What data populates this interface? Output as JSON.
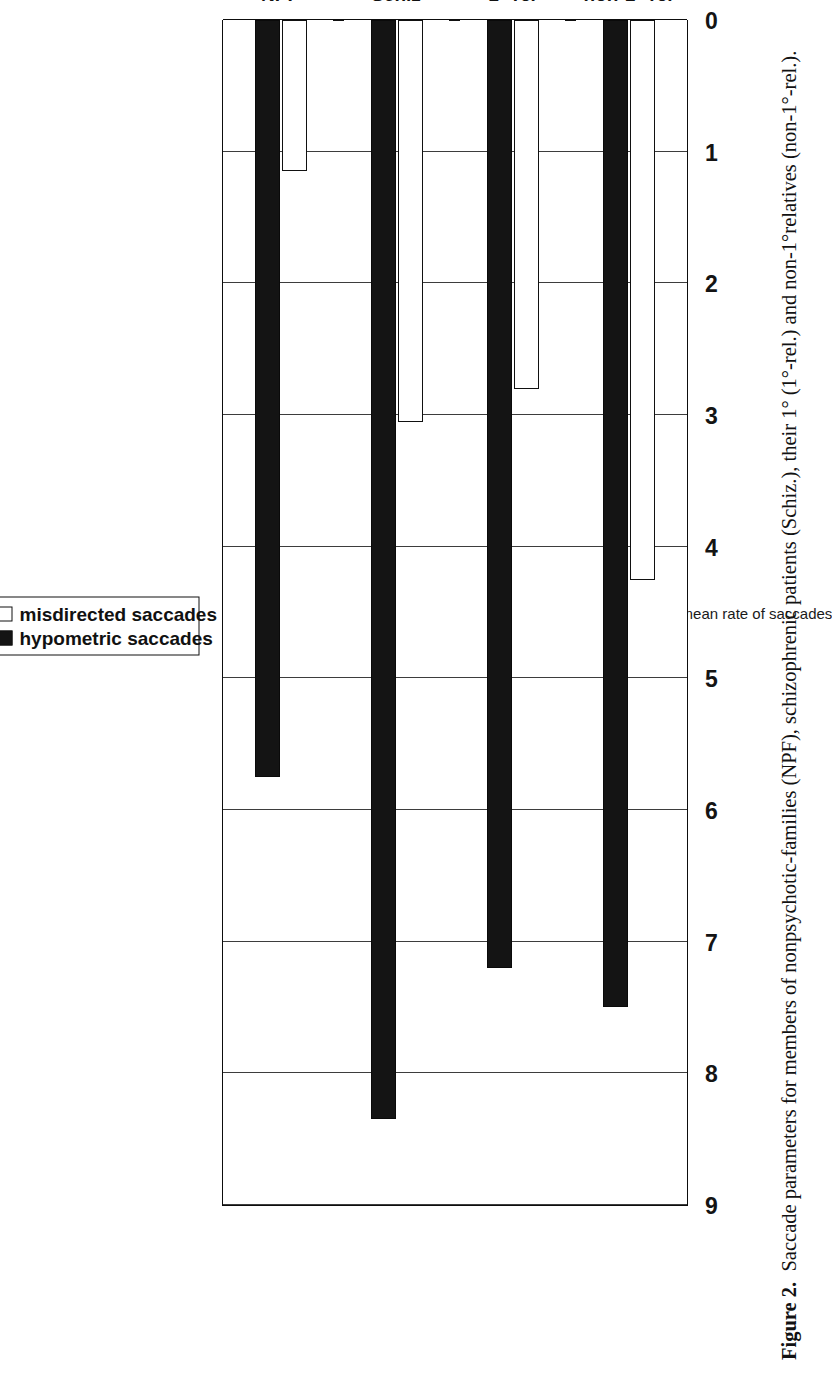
{
  "figure": {
    "caption_lead": "Figure 2.",
    "caption_body": "Saccade parameters for members of nonpsychotic-families (NPF), schizophrenic patients (Schiz.), their 1° (1°-rel.) and non-1°relatives (non-1°-rel.)."
  },
  "legend": {
    "position": "top-center",
    "entries": [
      {
        "label": "misdirected saccades",
        "swatch": "open-square-icon",
        "color": "#ffffff"
      },
      {
        "label": "hypometric saccades",
        "swatch": "filled-square-icon",
        "color": "#141414"
      }
    ]
  },
  "chart_data": {
    "type": "bar",
    "orientation": "horizontal",
    "title": "",
    "subtitle": "",
    "xlabel": "",
    "ylabel": "mean rate of saccades",
    "categories": [
      "NPF",
      "Schiz",
      "1°-rel",
      "non-1°-rel"
    ],
    "series": [
      {
        "name": "misdirected saccades",
        "values": [
          1.15,
          3.05,
          2.8,
          4.25
        ],
        "fill": "#ffffff",
        "stroke": "#111111"
      },
      {
        "name": "hypometric saccades",
        "values": [
          5.75,
          8.35,
          7.2,
          7.5
        ],
        "fill": "#141414",
        "stroke": "#0a0a0a"
      }
    ],
    "value_axis": {
      "label": "mean rate of saccades",
      "min": 0,
      "max": 9,
      "ticks": [
        0,
        1,
        2,
        3,
        4,
        5,
        6,
        7,
        8,
        9
      ],
      "tick_labels": [
        "0",
        "1",
        "2",
        "3",
        "4",
        "5",
        "6",
        "7",
        "8",
        "9"
      ],
      "direction": "reversed"
    },
    "grid": {
      "value_axis_gridlines": true,
      "category_axis_gridlines": false
    },
    "legend_position": "top-center",
    "colors": {
      "bar_open": "#ffffff",
      "bar_filled": "#141414",
      "axis": "#111111",
      "grid": "#3d3d3d"
    }
  }
}
